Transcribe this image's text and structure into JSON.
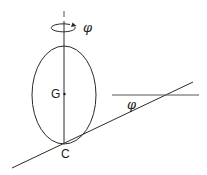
{
  "diagram": {
    "type": "physics-diagram",
    "labels": {
      "center_of_mass": "G",
      "contact_point": "C",
      "rotation_angle": "φ",
      "incline_angle": "φ"
    },
    "colors": {
      "stroke": "#2a2a2a",
      "background": "#ffffff"
    },
    "elements": {
      "vertical_axis": {
        "x": 64,
        "y1": 18,
        "y2": 143
      },
      "axis_tick": {
        "x": 64,
        "y1": 11,
        "y2": 17
      },
      "ellipse": {
        "cx": 64,
        "cy": 95,
        "rx": 32,
        "ry": 49
      },
      "rotation_arrow": {
        "cx": 64,
        "cy": 28,
        "rx": 12,
        "ry": 4
      },
      "incline_line": {
        "x1": 12,
        "y1": 168,
        "x2": 193,
        "y2": 82
      },
      "horizontal_line": {
        "x1": 112,
        "y1": 95,
        "x2": 199,
        "y2": 95
      }
    }
  }
}
